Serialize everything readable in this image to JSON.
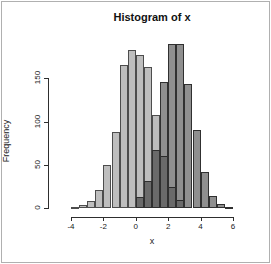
{
  "title": "Histogram of x",
  "axes": {
    "x_label": "x",
    "y_label": "Frequency",
    "x_ticks": [
      "-4",
      "-2",
      "0",
      "2",
      "4",
      "6"
    ],
    "y_ticks": [
      "0",
      "50",
      "100",
      "150"
    ]
  },
  "chart_data": {
    "type": "bar",
    "subtype": "overlaid-histograms",
    "title": "Histogram of x",
    "xlabel": "x",
    "ylabel": "Frequency",
    "xlim": [
      -4.5,
      6.5
    ],
    "ylim": [
      0,
      190
    ],
    "x_tick_values": [
      -4,
      -2,
      0,
      2,
      4,
      6
    ],
    "y_tick_values": [
      0,
      50,
      100,
      150
    ],
    "grid": "off",
    "legend": "none",
    "bin_width": 0.5,
    "series": [
      {
        "name": "histogram-left",
        "fill": "#BEBEBE",
        "border": "#4D4D4D",
        "bin_start": -4,
        "bin_edges": [
          -4,
          -3.5,
          -3,
          -2.5,
          -2,
          -1.5,
          -1,
          -0.5,
          0,
          0.5,
          1,
          1.5,
          2,
          2.5,
          3
        ],
        "counts": [
          2,
          4,
          8,
          21,
          50,
          88,
          165,
          183,
          177,
          163,
          108,
          60,
          25,
          10
        ]
      },
      {
        "name": "histogram-right",
        "fill": "rgba(0,0,0,0.44)",
        "border": "#303030",
        "bin_start": 0,
        "bin_edges": [
          0,
          0.5,
          1,
          1.5,
          2,
          2.5,
          3,
          3.5,
          4,
          4.5,
          5,
          5.5,
          6
        ],
        "counts": [
          13,
          31,
          67,
          146,
          190,
          190,
          144,
          90,
          42,
          14,
          5,
          2
        ]
      }
    ],
    "colors": {
      "hist1_fill": "#BEBEBE",
      "hist2_alone_apparent": "#8F8F8F",
      "overlap_apparent": "#6A6A6A",
      "axis": "#2e2e2e",
      "text": "#222222"
    }
  }
}
